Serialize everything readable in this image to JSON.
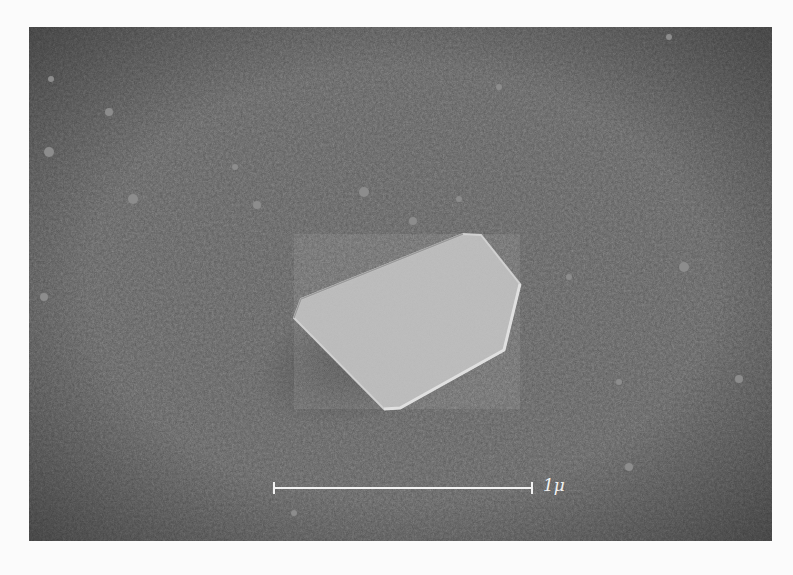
{
  "micrograph": {
    "description": "Electron micrograph of a single flat hexagonal crystal on a textured substrate",
    "colors": {
      "background_page": "#fbfbfb",
      "substrate": "#6f6f6f",
      "crystal": "#b9b9b9",
      "scale_bar": "#f2f2f2"
    },
    "crystal": {
      "shape": "elongated hexagon",
      "points": "265,291 272,272 434,207 452,208 491,257 475,323 371,381 355,382"
    },
    "scale_bar": {
      "label": "1μ",
      "x1": 245,
      "x2": 503,
      "y": 461
    }
  }
}
